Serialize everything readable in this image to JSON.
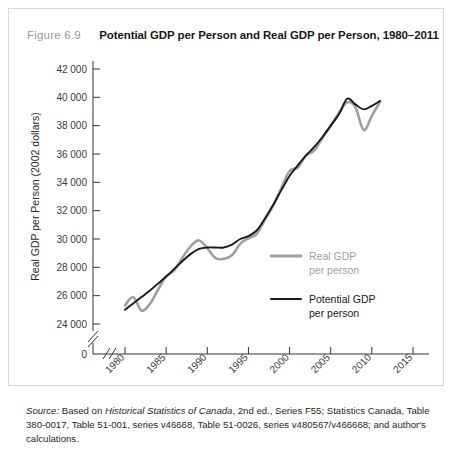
{
  "figure": {
    "number": "Figure 6.9",
    "title": "Potential GDP per Person and Real GDP per Person, 1980–2011"
  },
  "source": {
    "label": "Source:",
    "text_before_italic": " Based on ",
    "italic_work": "Historical Statistics of Canada",
    "text_after": ", 2nd ed., Series F55; Statistics Canada, Table 380-0017, Table 51-001, series v46668, Table 51-0026, series v480567/v466668; and author's calculations."
  },
  "legend": {
    "real_line1": "Real GDP",
    "real_line2": "per person",
    "potential_line1": "Potential GDP",
    "potential_line2": "per person"
  },
  "colors": {
    "real_gdp": "#a0a0a0",
    "potential_gdp": "#1a1a1a",
    "axis": "#333333",
    "figure_number": "#9a9a9a",
    "title": "#1a1a1a",
    "card_border": "#d8d8d8"
  },
  "chart_data": {
    "type": "line",
    "title": "Potential GDP per Person and Real GDP per Person, 1980–2011",
    "xlabel": "Year",
    "ylabel": "Real GDP per Person (2002 dollars)",
    "xlim": [
      1980,
      2015
    ],
    "ylim": [
      24000,
      42000
    ],
    "y_axis_break": true,
    "y_zero_label": "0",
    "grid": false,
    "legend_position": "inside-right",
    "xticks": [
      1980,
      1985,
      1990,
      1995,
      2000,
      2005,
      2010,
      2015
    ],
    "xtick_labels": [
      "1980",
      "1985",
      "1990",
      "1995",
      "2000",
      "2005",
      "2010",
      "2015"
    ],
    "yticks": [
      24000,
      26000,
      28000,
      30000,
      32000,
      34000,
      36000,
      38000,
      40000,
      42000
    ],
    "ytick_labels": [
      "24 000",
      "26 000",
      "28 000",
      "30 000",
      "32 000",
      "34 000",
      "36 000",
      "38 000",
      "40 000",
      "42 000"
    ],
    "x": [
      1980,
      1981,
      1982,
      1983,
      1984,
      1985,
      1986,
      1987,
      1988,
      1989,
      1990,
      1991,
      1992,
      1993,
      1994,
      1995,
      1996,
      1997,
      1998,
      1999,
      2000,
      2001,
      2002,
      2003,
      2004,
      2005,
      2006,
      2007,
      2008,
      2009,
      2010,
      2011
    ],
    "series": [
      {
        "name": "Real GDP per person",
        "color": "#a0a0a0",
        "values": [
          25300,
          25900,
          24950,
          25400,
          26400,
          27350,
          27800,
          28700,
          29500,
          29900,
          29350,
          28650,
          28600,
          28850,
          29650,
          30050,
          30350,
          31350,
          32350,
          33600,
          34800,
          35050,
          35900,
          36250,
          37150,
          38000,
          38900,
          39650,
          39300,
          37700,
          38700,
          39700
        ]
      },
      {
        "name": "Potential GDP per person",
        "color": "#1a1a1a",
        "values": [
          25000,
          25450,
          25900,
          26350,
          26850,
          27350,
          27900,
          28450,
          28950,
          29300,
          29400,
          29400,
          29400,
          29600,
          30000,
          30200,
          30600,
          31450,
          32400,
          33450,
          34450,
          35200,
          35900,
          36500,
          37200,
          38000,
          38800,
          39900,
          39500,
          39150,
          39400,
          39750
        ]
      }
    ]
  }
}
